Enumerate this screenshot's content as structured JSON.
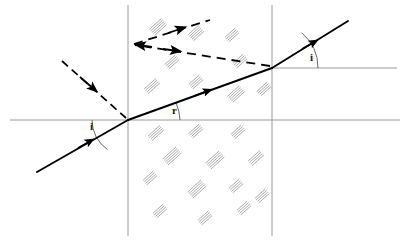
{
  "figure": {
    "kind": "physics-ray-diagram",
    "width": 401,
    "height": 241,
    "background_color": "#ffffff"
  },
  "colors": {
    "ray_solid": "#000000",
    "ray_dashed": "#000000",
    "normal_line": "#9a9a9a",
    "boundary_line": "#9a9a9a",
    "arc_line": "#555555",
    "hatch": "#a8a8a8",
    "label_text": "#1a1a1a"
  },
  "labels": [
    {
      "id": "angle-incidence-left",
      "text": "i",
      "x": 90,
      "y": 121,
      "meaning": "angle of incidence at first surface"
    },
    {
      "id": "angle-refraction",
      "text": "r",
      "x": 172,
      "y": 105,
      "meaning": "angle of refraction inside the medium"
    },
    {
      "id": "angle-emergence-right",
      "text": "i",
      "x": 310,
      "y": 52,
      "meaning": "angle of emergence at second surface"
    }
  ],
  "geometry": {
    "entry_point": {
      "x": 128,
      "y": 120
    },
    "exit_point": {
      "x": 272,
      "y": 68
    },
    "boundary_left_x": 128,
    "boundary_right_x": 272,
    "normal_left_y": 120,
    "normal_right_y": 68,
    "reflect_vertex": {
      "x": 133,
      "y": 45
    }
  },
  "lines": {
    "normal_left": {
      "x1": 10,
      "y1": 120,
      "x2": 400,
      "y2": 120
    },
    "normal_right": {
      "x1": 272,
      "y1": 68,
      "x2": 397,
      "y2": 68
    },
    "boundary_left": {
      "x1": 128,
      "y1": 5,
      "x2": 128,
      "y2": 236
    },
    "boundary_right": {
      "x1": 272,
      "y1": 5,
      "x2": 272,
      "y2": 236
    }
  },
  "rays": [
    {
      "id": "incident-ray",
      "style": "dashed",
      "from": {
        "x": 62,
        "y": 61
      },
      "to": {
        "x": 128,
        "y": 120
      },
      "arrow_at": {
        "x": 92,
        "y": 88
      },
      "description": "dashed incident ray arriving at first surface"
    },
    {
      "id": "undeviated-extension",
      "style": "solid",
      "from": {
        "x": 37,
        "y": 172
      },
      "to": {
        "x": 128,
        "y": 120
      },
      "arrow_at": {
        "x": 90,
        "y": 142
      },
      "description": "solid ray from lower left up to entry point"
    },
    {
      "id": "refracted-ray-inside",
      "style": "solid",
      "from": {
        "x": 128,
        "y": 120
      },
      "to": {
        "x": 272,
        "y": 68
      },
      "arrow_at": {
        "x": 208,
        "y": 97
      },
      "description": "refracted ray travelling through the medium"
    },
    {
      "id": "emergent-ray",
      "style": "solid",
      "from": {
        "x": 272,
        "y": 68
      },
      "to": {
        "x": 348,
        "y": 21
      },
      "arrow_at": {
        "x": 320,
        "y": 38
      },
      "description": "emergent ray leaving second surface"
    },
    {
      "id": "reflected-ray-back",
      "style": "dashed",
      "from": {
        "x": 272,
        "y": 68
      },
      "to": {
        "x": 133,
        "y": 45
      },
      "arrow_at": {
        "x": 172,
        "y": 52
      },
      "description": "dashed ray returning to the left toward vertex"
    },
    {
      "id": "reflected-ray-up",
      "style": "dashed",
      "from": {
        "x": 133,
        "y": 45
      },
      "to": {
        "x": 208,
        "y": 21
      },
      "arrow_at": {
        "x": 186,
        "y": 28
      },
      "description": "dashed ray going up and to the right from vertex"
    }
  ],
  "arcs": [
    {
      "id": "arc-angle-i-left",
      "cx": 128,
      "cy": 120,
      "r": 36,
      "meaning": "arc marking angle i at entry"
    },
    {
      "id": "arc-angle-r",
      "cx": 128,
      "cy": 120,
      "r": 52,
      "meaning": "arc marking angle r inside medium"
    },
    {
      "id": "arc-angle-i-right",
      "cx": 272,
      "cy": 68,
      "r": 46,
      "meaning": "arc marking angle i at exit"
    }
  ],
  "hatching": {
    "note": "scattered short parallel diagonal strokes indicating the glass medium",
    "marks": [
      {
        "x": 158,
        "y": 27
      },
      {
        "x": 196,
        "y": 33
      },
      {
        "x": 232,
        "y": 35
      },
      {
        "x": 172,
        "y": 62
      },
      {
        "x": 240,
        "y": 61
      },
      {
        "x": 152,
        "y": 86
      },
      {
        "x": 196,
        "y": 82
      },
      {
        "x": 236,
        "y": 94
      },
      {
        "x": 264,
        "y": 89
      },
      {
        "x": 156,
        "y": 133
      },
      {
        "x": 196,
        "y": 131
      },
      {
        "x": 238,
        "y": 132
      },
      {
        "x": 172,
        "y": 156
      },
      {
        "x": 215,
        "y": 160
      },
      {
        "x": 256,
        "y": 158
      },
      {
        "x": 150,
        "y": 178
      },
      {
        "x": 197,
        "y": 189
      },
      {
        "x": 236,
        "y": 186
      },
      {
        "x": 262,
        "y": 196
      },
      {
        "x": 160,
        "y": 211
      },
      {
        "x": 205,
        "y": 218
      },
      {
        "x": 244,
        "y": 208
      }
    ]
  }
}
